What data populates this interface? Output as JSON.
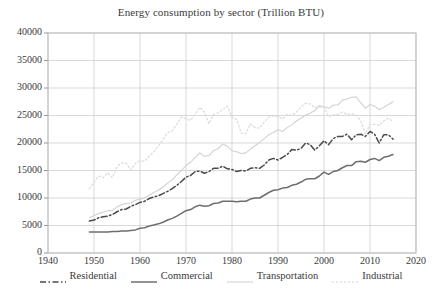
{
  "chart_data": {
    "type": "line",
    "title": "Energy consumption by sector (Trillion BTU)",
    "xlabel": "",
    "ylabel": "",
    "xlim": [
      1940,
      2020
    ],
    "ylim": [
      0,
      40000
    ],
    "xticks": [
      "1940",
      "1950",
      "1960",
      "1970",
      "1980",
      "1990",
      "2000",
      "2010",
      "2020"
    ],
    "yticks": [
      "0",
      "5000",
      "10000",
      "15000",
      "20000",
      "25000",
      "30000",
      "35000",
      "40000"
    ],
    "grid": true,
    "legend_position": "bottom",
    "x": [
      1949,
      1950,
      1951,
      1952,
      1953,
      1954,
      1955,
      1956,
      1957,
      1958,
      1959,
      1960,
      1961,
      1962,
      1963,
      1964,
      1965,
      1966,
      1967,
      1968,
      1969,
      1970,
      1971,
      1972,
      1973,
      1974,
      1975,
      1976,
      1977,
      1978,
      1979,
      1980,
      1981,
      1982,
      1983,
      1984,
      1985,
      1986,
      1987,
      1988,
      1989,
      1990,
      1991,
      1992,
      1993,
      1994,
      1995,
      1996,
      1997,
      1998,
      1999,
      2000,
      2001,
      2002,
      2003,
      2004,
      2005,
      2006,
      2007,
      2008,
      2009,
      2010,
      2011,
      2012,
      2013,
      2014,
      2015
    ],
    "series": [
      {
        "name": "Residential",
        "style": "dash-dot",
        "color": "#4a4a4a",
        "values": [
          5800,
          6000,
          6400,
          6600,
          6700,
          7000,
          7500,
          7900,
          8000,
          8500,
          8800,
          9200,
          9400,
          9900,
          10200,
          10400,
          10800,
          11200,
          11700,
          12300,
          13000,
          13800,
          14100,
          14800,
          14900,
          14500,
          14800,
          15400,
          15400,
          15800,
          15300,
          15200,
          14800,
          15000,
          14900,
          15400,
          15500,
          15400,
          16000,
          16900,
          17200,
          16900,
          17400,
          17900,
          18800,
          18700,
          19000,
          20000,
          19700,
          18700,
          19500,
          20400,
          19700,
          20800,
          21200,
          21200,
          21600,
          20600,
          21500,
          21600,
          21200,
          22100,
          21600,
          20000,
          21500,
          21500,
          20700
        ]
      },
      {
        "name": "Commercial",
        "style": "solid",
        "color": "#6e6e6e",
        "values": [
          3800,
          3800,
          3800,
          3800,
          3800,
          3900,
          3900,
          4000,
          4000,
          4100,
          4200,
          4500,
          4600,
          4900,
          5100,
          5300,
          5600,
          6000,
          6300,
          6700,
          7200,
          7700,
          7900,
          8400,
          8700,
          8500,
          8600,
          9000,
          9100,
          9400,
          9400,
          9400,
          9300,
          9400,
          9400,
          9800,
          10000,
          10000,
          10500,
          11000,
          11400,
          11500,
          11800,
          11900,
          12300,
          12500,
          12900,
          13400,
          13500,
          13500,
          14000,
          14700,
          14300,
          14800,
          15000,
          15500,
          15900,
          15900,
          16600,
          16700,
          16500,
          17000,
          17200,
          16800,
          17400,
          17600,
          17900
        ]
      },
      {
        "name": "Transportation",
        "style": "light-solid",
        "color": "#d2d2d2",
        "values": [
          6400,
          6800,
          7200,
          7400,
          7700,
          7700,
          8400,
          8800,
          9000,
          9100,
          9600,
          9800,
          10000,
          10500,
          11000,
          11400,
          12000,
          12700,
          13300,
          14200,
          15000,
          15900,
          16500,
          17400,
          18200,
          17600,
          17700,
          18600,
          19000,
          19800,
          19400,
          18600,
          18400,
          18100,
          18200,
          18900,
          19500,
          20100,
          20800,
          21500,
          21900,
          22400,
          22100,
          22800,
          23300,
          24000,
          24500,
          25100,
          25400,
          25900,
          26800,
          26600,
          26300,
          26900,
          26900,
          27800,
          28000,
          28300,
          28400,
          27300,
          26300,
          27000,
          26700,
          26100,
          26500,
          27000,
          27500
        ]
      },
      {
        "name": "Industrial",
        "style": "dotted-light",
        "color": "#dcdcdc",
        "values": [
          11700,
          12800,
          14000,
          13700,
          14600,
          13700,
          15700,
          16400,
          16300,
          15100,
          16300,
          16800,
          16700,
          17600,
          18400,
          19500,
          20600,
          21900,
          22200,
          23400,
          24700,
          24400,
          24100,
          25300,
          26500,
          25600,
          23500,
          25200,
          25500,
          26100,
          26700,
          24700,
          24300,
          21800,
          21700,
          23500,
          22800,
          22700,
          23800,
          24700,
          24900,
          24800,
          24400,
          25200,
          25000,
          25600,
          26600,
          27200,
          27100,
          26500,
          26500,
          26600,
          24800,
          25100,
          25200,
          25600,
          25200,
          25300,
          25100,
          24000,
          21600,
          23400,
          23400,
          23200,
          24000,
          24500,
          23900
        ]
      }
    ]
  }
}
